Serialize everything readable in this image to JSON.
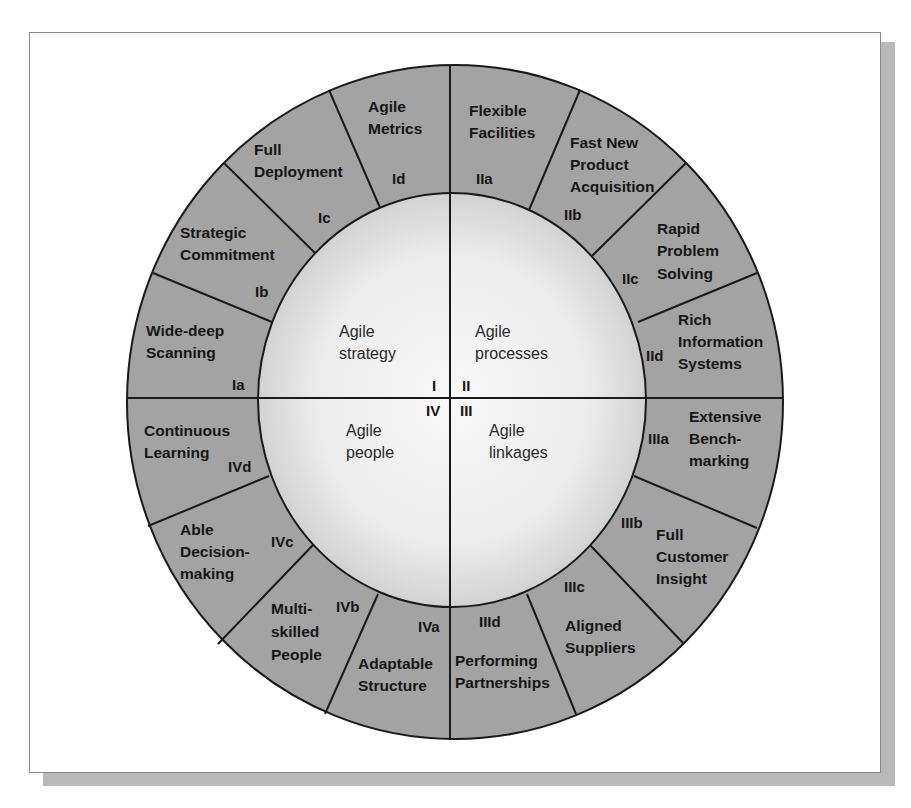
{
  "diagram": {
    "colors": {
      "ring_fill": "#a3a3a3",
      "inner_fill_edge": "#dcdcdc",
      "inner_fill_center": "#f7f7f7",
      "stroke": "#1a1a1a",
      "frame_border": "#8a8a8a",
      "shadow": "#b9b9b9"
    },
    "quadrants": [
      {
        "numeral": "I",
        "label_line1": "Agile",
        "label_line2": "strategy"
      },
      {
        "numeral": "II",
        "label_line1": "Agile",
        "label_line2": "processes"
      },
      {
        "numeral": "III",
        "label_line1": "Agile",
        "label_line2": "linkages"
      },
      {
        "numeral": "IV",
        "label_line1": "Agile",
        "label_line2": "people"
      }
    ],
    "segments": {
      "Ia": {
        "code": "Ia",
        "lines": [
          "Wide-deep",
          "Scanning"
        ]
      },
      "Ib": {
        "code": "Ib",
        "lines": [
          "Strategic",
          "Commitment"
        ]
      },
      "Ic": {
        "code": "Ic",
        "lines": [
          "Full",
          "Deployment"
        ]
      },
      "Id": {
        "code": "Id",
        "lines": [
          "Agile",
          "Metrics"
        ]
      },
      "IIa": {
        "code": "IIa",
        "lines": [
          "Flexible",
          "Facilities"
        ]
      },
      "IIb": {
        "code": "IIb",
        "lines": [
          "Fast New",
          "Product",
          "Acquisition"
        ]
      },
      "IIc": {
        "code": "IIc",
        "lines": [
          "Rapid",
          "Problem",
          "Solving"
        ]
      },
      "IId": {
        "code": "IId",
        "lines": [
          "Rich",
          "Information",
          "Systems"
        ]
      },
      "IIIa": {
        "code": "IIIa",
        "lines": [
          "Extensive",
          "Bench-",
          "marking"
        ]
      },
      "IIIb": {
        "code": "IIIb",
        "lines": [
          "Full",
          "Customer",
          "Insight"
        ]
      },
      "IIIc": {
        "code": "IIIc",
        "lines": [
          "Aligned",
          "Suppliers"
        ]
      },
      "IIId": {
        "code": "IIId",
        "lines": [
          "Performing",
          "Partnerships"
        ]
      },
      "IVa": {
        "code": "IVa",
        "lines": [
          "Adaptable",
          "Structure"
        ]
      },
      "IVb": {
        "code": "IVb",
        "lines": [
          "Multi-",
          "skilled",
          "People"
        ]
      },
      "IVc": {
        "code": "IVc",
        "lines": [
          "Able",
          "Decision-",
          "making"
        ]
      },
      "IVd": {
        "code": "IVd",
        "lines": [
          "Continuous",
          "Learning"
        ]
      }
    }
  }
}
